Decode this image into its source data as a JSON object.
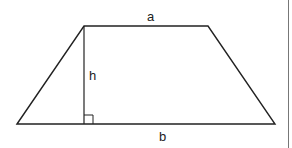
{
  "diagram": {
    "labels": {
      "top_base": "a",
      "height": "h",
      "bottom_base": "b"
    },
    "colors": {
      "stroke": "#222222",
      "border": "#777777",
      "background": "#ffffff"
    },
    "shape": {
      "type": "trapezoid",
      "vertices": [
        [
          17,
          124
        ],
        [
          84,
          26
        ],
        [
          208,
          26
        ],
        [
          275,
          124
        ]
      ],
      "height_line": [
        [
          84,
          26
        ],
        [
          84,
          124
        ]
      ],
      "right_angle_marker": {
        "x": 84,
        "y": 115,
        "size": 9
      }
    }
  }
}
